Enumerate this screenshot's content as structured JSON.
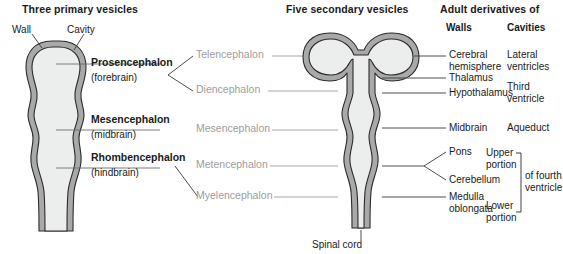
{
  "headers": {
    "primary": "Three primary vesicles",
    "secondary": "Five secondary vesicles",
    "adult": "Adult derivatives of",
    "walls": "Walls",
    "cavities": "Cavities"
  },
  "callouts": {
    "wall": "Wall",
    "cavity": "Cavity",
    "spinal_cord": "Spinal cord"
  },
  "primary_vesicles": [
    {
      "name": "Prosencephalon",
      "common": "(forebrain)"
    },
    {
      "name": "Mesencephalon",
      "common": "(midbrain)"
    },
    {
      "name": "Rhombencephalon",
      "common": "(hindbrain)"
    }
  ],
  "secondary_vesicles": [
    {
      "name": "Telencephalon"
    },
    {
      "name": "Diencephalon"
    },
    {
      "name": "Mesencephalon"
    },
    {
      "name": "Metencephalon"
    },
    {
      "name": "Myelencephalon"
    }
  ],
  "walls": [
    {
      "line1": "Cerebral",
      "line2": "hemisphere"
    },
    {
      "line1": "Thalamus",
      "line2": ""
    },
    {
      "line1": "Hypothalamus",
      "line2": ""
    },
    {
      "line1": "Midbrain",
      "line2": ""
    },
    {
      "line1": "Pons",
      "line2": ""
    },
    {
      "line1": "Cerebellum",
      "line2": ""
    },
    {
      "line1": "Medulla",
      "line2": "oblongata"
    }
  ],
  "cavities": [
    {
      "line1": "Lateral",
      "line2": "ventricles"
    },
    {
      "line1": "Third",
      "line2": "ventricle"
    },
    {
      "line1": "Aqueduct",
      "line2": ""
    },
    {
      "line1": "Upper",
      "line2": "portion"
    },
    {
      "line1": "Lower",
      "line2": "portion"
    }
  ],
  "cavity_bracket_label": "of fourth ventricle",
  "colors": {
    "wall_fill": "#a9a9a9",
    "cavity_fill": "#eceded",
    "outline": "#2b2b2b",
    "leader": "#3a3a3a",
    "gray_text": "#9d9d9d",
    "text": "#1a1a1a",
    "background": "#ffffff"
  }
}
